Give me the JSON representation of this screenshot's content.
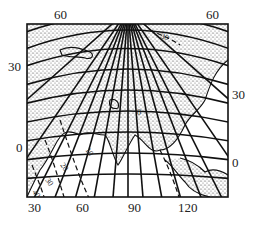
{
  "figure": {
    "type": "map",
    "colors": {
      "ink": "#111111",
      "land": "#cfcfcf",
      "background": "#ffffff"
    }
  },
  "labels": {
    "top": [
      "60",
      "60"
    ],
    "left": [
      "30",
      "0"
    ],
    "right": [
      "30",
      "0"
    ],
    "bottom": [
      "30",
      "60",
      "90",
      "120"
    ]
  },
  "isolines": {
    "values": [
      "10",
      "20",
      "30",
      "40",
      "0"
    ]
  }
}
